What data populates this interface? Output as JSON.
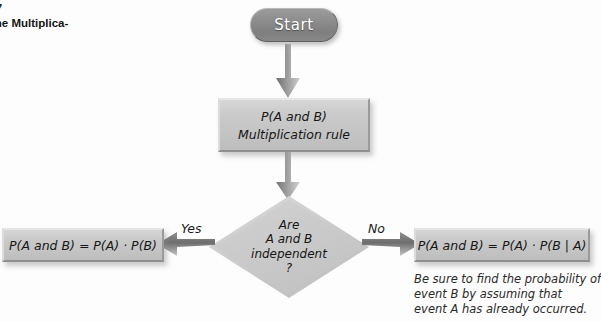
{
  "caption": {
    "number": "7",
    "text": "the Multiplica-"
  },
  "colors": {
    "page_background": "#fdfdfd",
    "start_fill": "#8d8d8d",
    "start_text": "#ffffff",
    "node_fill": "#c8c8c8",
    "node_text": "#161616",
    "arrow": "#8c8c8c"
  },
  "flowchart": {
    "start": {
      "label": "Start",
      "shape": "rounded-pill"
    },
    "process": {
      "shape": "rectangle",
      "lines": [
        "P(A and B)",
        "Multiplication rule"
      ]
    },
    "decision": {
      "shape": "diamond",
      "lines": [
        "Are",
        "A and B",
        "independent",
        "?"
      ]
    },
    "branches": {
      "yes": {
        "label": "Yes",
        "direction": "left",
        "result": "P(A and B) = P(A) · P(B)"
      },
      "no": {
        "label": "No",
        "direction": "right",
        "result": "P(A and B) = P(A) · P(B | A)",
        "note_lines": [
          "Be sure to find the probability of",
          "event B by assuming that",
          "event A has already occurred."
        ]
      }
    },
    "connectors": [
      {
        "name": "start-to-process",
        "direction": "down"
      },
      {
        "name": "process-to-decision",
        "direction": "down"
      },
      {
        "name": "decision-to-yes",
        "direction": "left"
      },
      {
        "name": "decision-to-no",
        "direction": "right"
      }
    ]
  }
}
